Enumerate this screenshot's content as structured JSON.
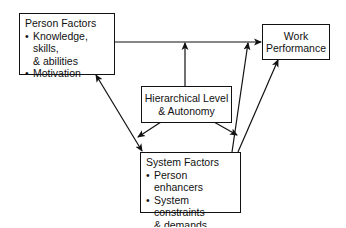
{
  "diagram": {
    "nodes": {
      "person_factors": {
        "title": "Person Factors",
        "bullets": [
          "Knowledge, skills, & abilities",
          "Motivation"
        ],
        "bullet_lines": [
          [
            "Knowledge, skills,",
            "& abilities"
          ],
          [
            "Motivation"
          ]
        ]
      },
      "work_performance": {
        "line1": "Work",
        "line2": "Performance"
      },
      "hierarchical": {
        "line1": "Hierarchical Level",
        "line2": "& Autonomy"
      },
      "system_factors": {
        "title": "System Factors",
        "bullets": [
          "Person enhancers",
          "System constraints & demands"
        ],
        "bullet_lines": [
          [
            "Person enhancers"
          ],
          [
            "System constraints",
            "& demands"
          ]
        ]
      }
    },
    "edges": [
      {
        "from": "Person Factors",
        "to": "Work Performance",
        "type": "arrow"
      },
      {
        "from": "Hierarchical Level & Autonomy",
        "to": "Person-Work link",
        "type": "arrow"
      },
      {
        "from": "System Factors",
        "to": "Person-Work link",
        "type": "arrow"
      },
      {
        "from": "System Factors",
        "to": "Work Performance",
        "type": "arrow"
      },
      {
        "from": "Person Factors",
        "to": "System Factors",
        "type": "bidirectional"
      },
      {
        "from": "Hierarchical Level & Autonomy",
        "to": "System Factors",
        "type": "arrow",
        "side": "left"
      },
      {
        "from": "Hierarchical Level & Autonomy",
        "to": "System Factors",
        "type": "arrow",
        "side": "right"
      }
    ],
    "colors": {
      "line": "#111111",
      "background": "#ffffff"
    }
  }
}
